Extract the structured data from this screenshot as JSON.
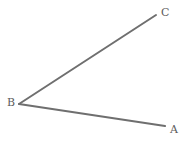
{
  "figure": {
    "kind": "geometry-angle-diagram",
    "canvas": {
      "width": 191,
      "height": 144,
      "background": "#ffffff"
    },
    "style": {
      "stroke_color": "#6f6f6f",
      "stroke_width": 2,
      "label_color": "#5c5c5c",
      "label_font_size": 11
    },
    "points": [
      {
        "id": "A",
        "label": "A",
        "x": 165,
        "y": 126,
        "label_x": 174,
        "label_y": 130
      },
      {
        "id": "B",
        "label": "B",
        "x": 19,
        "y": 104,
        "label_x": 11,
        "label_y": 103
      },
      {
        "id": "C",
        "label": "C",
        "x": 156,
        "y": 15,
        "label_x": 165,
        "label_y": 13
      }
    ],
    "segments": [
      {
        "id": "BC",
        "from": "B",
        "to": "C",
        "x1": 19,
        "y1": 104,
        "x2": 156,
        "y2": 15
      },
      {
        "id": "BA",
        "from": "B",
        "to": "A",
        "x1": 19,
        "y1": 104,
        "x2": 165,
        "y2": 126
      }
    ],
    "vertex": "B",
    "labels": {
      "a": "A",
      "b": "B",
      "c": "C"
    }
  }
}
